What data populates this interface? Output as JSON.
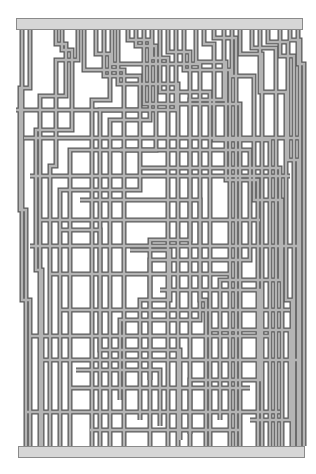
{
  "diagram": {
    "type": "pipe-maze",
    "caption": "",
    "colors": {
      "background": "#ffffff",
      "pipe_outline": "#5a5a5a",
      "pipe_fill": "#b4b4b4",
      "bar_fill": "#d6d6d6",
      "bar_outline": "#8a8a8a"
    },
    "pipe_width": 5,
    "pipe_inner_width": 2.4,
    "top_bar": {
      "x": 16,
      "y": 18,
      "width": 287,
      "height": 12
    },
    "bottom_bar": {
      "x": 18,
      "y": 446,
      "width": 287,
      "height": 12
    },
    "pipes": [
      [
        [
          22,
          30
        ],
        [
          22,
          300
        ],
        [
          30,
          300
        ],
        [
          30,
          446
        ]
      ],
      [
        [
          30,
          30
        ],
        [
          30,
          88
        ],
        [
          20,
          88
        ],
        [
          20,
          210
        ],
        [
          26,
          210
        ],
        [
          26,
          446
        ]
      ],
      [
        [
          56,
          30
        ],
        [
          56,
          44
        ],
        [
          66,
          44
        ],
        [
          66,
          96
        ],
        [
          40,
          96
        ],
        [
          40,
          446
        ]
      ],
      [
        [
          62,
          30
        ],
        [
          62,
          50
        ],
        [
          72,
          50
        ],
        [
          72,
          130
        ],
        [
          36,
          130
        ],
        [
          36,
          270
        ],
        [
          42,
          270
        ],
        [
          42,
          446
        ]
      ],
      [
        [
          78,
          30
        ],
        [
          78,
          60
        ],
        [
          56,
          60
        ],
        [
          56,
          166
        ],
        [
          50,
          166
        ],
        [
          50,
          446
        ]
      ],
      [
        [
          84,
          30
        ],
        [
          84,
          70
        ],
        [
          124,
          70
        ],
        [
          124,
          446
        ]
      ],
      [
        [
          96,
          30
        ],
        [
          96,
          54
        ],
        [
          110,
          54
        ],
        [
          110,
          100
        ],
        [
          92,
          100
        ],
        [
          92,
          446
        ]
      ],
      [
        [
          104,
          30
        ],
        [
          104,
          76
        ],
        [
          140,
          76
        ],
        [
          140,
          190
        ],
        [
          60,
          190
        ],
        [
          60,
          446
        ]
      ],
      [
        [
          112,
          30
        ],
        [
          112,
          64
        ],
        [
          200,
          64
        ],
        [
          200,
          300
        ],
        [
          206,
          300
        ],
        [
          206,
          446
        ]
      ],
      [
        [
          118,
          30
        ],
        [
          118,
          84
        ],
        [
          178,
          84
        ],
        [
          178,
          446
        ]
      ],
      [
        [
          128,
          30
        ],
        [
          128,
          40
        ],
        [
          150,
          40
        ],
        [
          150,
          120
        ],
        [
          110,
          120
        ],
        [
          110,
          446
        ]
      ],
      [
        [
          136,
          30
        ],
        [
          136,
          46
        ],
        [
          156,
          46
        ],
        [
          156,
          150
        ],
        [
          70,
          150
        ],
        [
          70,
          446
        ]
      ],
      [
        [
          144,
          30
        ],
        [
          144,
          104
        ],
        [
          240,
          104
        ],
        [
          240,
          446
        ]
      ],
      [
        [
          152,
          30
        ],
        [
          152,
          58
        ],
        [
          168,
          58
        ],
        [
          168,
          446
        ]
      ],
      [
        [
          160,
          30
        ],
        [
          160,
          92
        ],
        [
          210,
          92
        ],
        [
          210,
          446
        ]
      ],
      [
        [
          168,
          30
        ],
        [
          168,
          52
        ],
        [
          190,
          52
        ],
        [
          190,
          240
        ],
        [
          150,
          240
        ],
        [
          150,
          446
        ]
      ],
      [
        [
          176,
          30
        ],
        [
          176,
          110
        ],
        [
          100,
          110
        ],
        [
          100,
          446
        ]
      ],
      [
        [
          184,
          30
        ],
        [
          184,
          70
        ],
        [
          230,
          70
        ],
        [
          230,
          446
        ]
      ],
      [
        [
          196,
          30
        ],
        [
          196,
          62
        ],
        [
          226,
          62
        ],
        [
          226,
          180
        ],
        [
          258,
          180
        ],
        [
          258,
          446
        ]
      ],
      [
        [
          204,
          30
        ],
        [
          204,
          44
        ],
        [
          214,
          44
        ],
        [
          214,
          140
        ],
        [
          270,
          140
        ],
        [
          270,
          446
        ]
      ],
      [
        [
          214,
          30
        ],
        [
          214,
          38
        ],
        [
          236,
          38
        ],
        [
          236,
          446
        ]
      ],
      [
        [
          224,
          30
        ],
        [
          224,
          100
        ],
        [
          190,
          100
        ],
        [
          190,
          446
        ]
      ],
      [
        [
          232,
          30
        ],
        [
          232,
          76
        ],
        [
          254,
          76
        ],
        [
          254,
          200
        ],
        [
          282,
          200
        ],
        [
          282,
          446
        ]
      ],
      [
        [
          240,
          30
        ],
        [
          240,
          54
        ],
        [
          262,
          54
        ],
        [
          262,
          446
        ]
      ],
      [
        [
          252,
          30
        ],
        [
          252,
          48
        ],
        [
          276,
          48
        ],
        [
          276,
          446
        ]
      ],
      [
        [
          260,
          30
        ],
        [
          260,
          92
        ],
        [
          286,
          92
        ],
        [
          286,
          300
        ],
        [
          292,
          300
        ],
        [
          292,
          446
        ]
      ],
      [
        [
          268,
          30
        ],
        [
          268,
          42
        ],
        [
          288,
          42
        ],
        [
          288,
          160
        ],
        [
          298,
          160
        ],
        [
          298,
          446
        ]
      ],
      [
        [
          280,
          30
        ],
        [
          280,
          56
        ],
        [
          294,
          56
        ],
        [
          294,
          446
        ]
      ],
      [
        [
          290,
          30
        ],
        [
          290,
          40
        ],
        [
          300,
          40
        ],
        [
          300,
          446
        ]
      ],
      [
        [
          298,
          30
        ],
        [
          298,
          64
        ],
        [
          304,
          64
        ],
        [
          304,
          446
        ]
      ],
      [
        [
          16,
          110
        ],
        [
          150,
          110
        ]
      ],
      [
        [
          24,
          138
        ],
        [
          300,
          138
        ]
      ],
      [
        [
          30,
          176
        ],
        [
          290,
          176
        ]
      ],
      [
        [
          40,
          220
        ],
        [
          260,
          220
        ]
      ],
      [
        [
          30,
          246
        ],
        [
          300,
          246
        ]
      ],
      [
        [
          50,
          274
        ],
        [
          230,
          274
        ]
      ],
      [
        [
          60,
          310
        ],
        [
          290,
          310
        ]
      ],
      [
        [
          30,
          336
        ],
        [
          270,
          336
        ]
      ],
      [
        [
          40,
          360
        ],
        [
          300,
          360
        ]
      ],
      [
        [
          70,
          388
        ],
        [
          250,
          388
        ]
      ],
      [
        [
          26,
          412
        ],
        [
          280,
          412
        ]
      ],
      [
        [
          90,
          430
        ],
        [
          240,
          430
        ]
      ],
      [
        [
          120,
          150
        ],
        [
          250,
          150
        ],
        [
          250,
          260
        ],
        [
          150,
          260
        ],
        [
          150,
          380
        ]
      ],
      [
        [
          80,
          200
        ],
        [
          200,
          200
        ],
        [
          200,
          320
        ],
        [
          120,
          320
        ],
        [
          120,
          400
        ]
      ],
      [
        [
          140,
          168
        ],
        [
          280,
          168
        ],
        [
          280,
          280
        ],
        [
          220,
          280
        ],
        [
          220,
          420
        ]
      ],
      [
        [
          60,
          230
        ],
        [
          100,
          230
        ],
        [
          100,
          350
        ],
        [
          180,
          350
        ],
        [
          180,
          440
        ]
      ],
      [
        [
          160,
          290
        ],
        [
          260,
          290
        ],
        [
          260,
          380
        ],
        [
          190,
          380
        ],
        [
          190,
          434
        ]
      ],
      [
        [
          130,
          250
        ],
        [
          170,
          250
        ],
        [
          170,
          300
        ],
        [
          140,
          300
        ],
        [
          140,
          420
        ]
      ],
      [
        [
          210,
          330
        ],
        [
          290,
          330
        ],
        [
          290,
          420
        ],
        [
          250,
          420
        ]
      ],
      [
        [
          76,
          370
        ],
        [
          160,
          370
        ],
        [
          160,
          426
        ]
      ]
    ]
  }
}
